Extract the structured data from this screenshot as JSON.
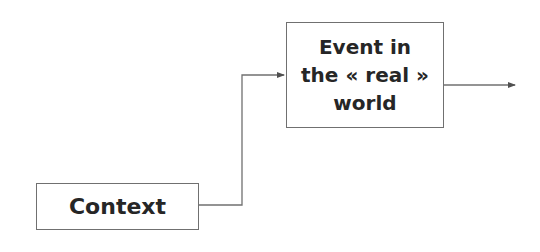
{
  "diagram": {
    "nodes": [
      {
        "id": "event",
        "label": "Event in\nthe « real »\nworld"
      },
      {
        "id": "context",
        "label": "Context"
      }
    ],
    "edges": [
      {
        "from": "context",
        "to": "event",
        "style": "elbow-arrow"
      },
      {
        "from": "event",
        "to": "outside-right",
        "style": "arrow"
      }
    ],
    "colors": {
      "line": "#707070",
      "text": "#262626",
      "background": "#ffffff"
    }
  }
}
